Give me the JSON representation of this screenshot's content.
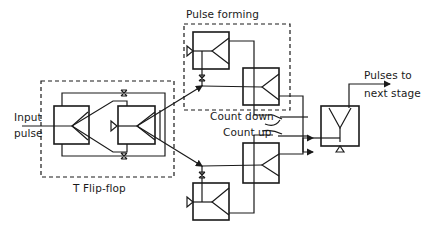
{
  "diagram": {
    "groups": [
      {
        "id": "t-flip-flop",
        "label": "T Flip-flop"
      },
      {
        "id": "pulse-forming",
        "label": "Pulse forming"
      }
    ],
    "labels": {
      "input": [
        "Input",
        "pulse"
      ],
      "t_flip_flop": "T Flip-flop",
      "pulse_forming": "Pulse forming",
      "count_down": "Count down",
      "count_up": "Count up",
      "output": [
        "Pulses to",
        "next stage"
      ]
    },
    "blocks": [
      {
        "id": "ff-left",
        "group": "t-flip-flop"
      },
      {
        "id": "ff-right",
        "group": "t-flip-flop"
      },
      {
        "id": "pf-upper-1",
        "group": "pulse-forming"
      },
      {
        "id": "pf-upper-2",
        "group": "pulse-forming"
      },
      {
        "id": "pf-lower-1"
      },
      {
        "id": "pf-lower-2"
      },
      {
        "id": "output-gate"
      }
    ],
    "colors": {
      "line": "#1a1a1a",
      "background": "#ffffff"
    }
  }
}
